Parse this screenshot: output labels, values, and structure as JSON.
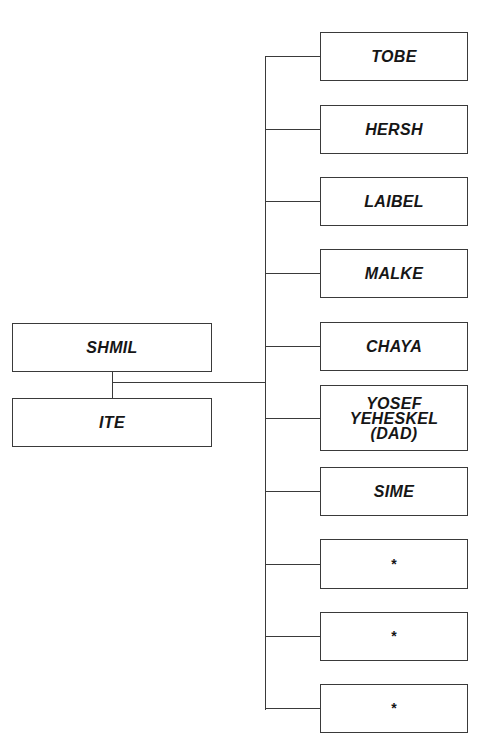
{
  "parents": [
    {
      "name": "SHMIL",
      "x": 12,
      "y": 323,
      "w": 200,
      "h": 49
    },
    {
      "name": "ITE",
      "x": 12,
      "y": 398,
      "w": 200,
      "h": 49
    }
  ],
  "children": [
    {
      "name": "TOBE",
      "y": 32,
      "h": 49
    },
    {
      "name": "HERSH",
      "y": 105,
      "h": 49
    },
    {
      "name": "LAIBEL",
      "y": 177,
      "h": 49
    },
    {
      "name": "MALKE",
      "y": 249,
      "h": 49
    },
    {
      "name": "CHAYA",
      "y": 322,
      "h": 49
    },
    {
      "name": "YOSEF\nYEHESKEL\n(DAD)",
      "y": 385,
      "h": 66
    },
    {
      "name": "SIME",
      "y": 467,
      "h": 49
    },
    {
      "name": "*",
      "y": 539,
      "h": 50
    },
    {
      "name": "*",
      "y": 612,
      "h": 49
    },
    {
      "name": "*",
      "y": 684,
      "h": 49
    }
  ],
  "layout": {
    "child_x": 320,
    "child_w": 148,
    "trunk_x": 266,
    "trunk_top": 57,
    "trunk_bottom": 709,
    "couple_x": 113,
    "couple_line_y": 383,
    "line_color": "#3a3a3a"
  }
}
